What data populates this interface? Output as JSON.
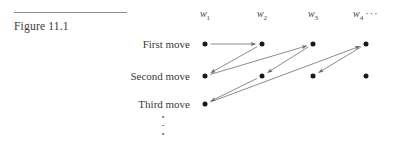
{
  "figure": {
    "caption": "Figure 11.1",
    "rule_color": "#8a8a8a"
  },
  "columns": [
    {
      "label": "w",
      "subscript": "1",
      "x": 205
    },
    {
      "label": "w",
      "subscript": "2",
      "x": 262
    },
    {
      "label": "w",
      "subscript": "3",
      "x": 313
    },
    {
      "label": "w",
      "subscript": "4",
      "x": 366
    }
  ],
  "column_trailing_ellipsis": "···",
  "rows": [
    {
      "label": "First move",
      "y": 44
    },
    {
      "label": "Second move",
      "y": 76
    },
    {
      "label": "Third move",
      "y": 104
    }
  ],
  "row_continuation_dots": 3,
  "nodes": [
    {
      "col": 0,
      "row": 0
    },
    {
      "col": 1,
      "row": 0
    },
    {
      "col": 2,
      "row": 0
    },
    {
      "col": 3,
      "row": 0
    },
    {
      "col": 0,
      "row": 1
    },
    {
      "col": 1,
      "row": 1
    },
    {
      "col": 2,
      "row": 1
    },
    {
      "col": 3,
      "row": 1
    },
    {
      "col": 0,
      "row": 2
    }
  ],
  "arrows": [
    {
      "from": {
        "col": 0,
        "row": 0
      },
      "to": {
        "col": 1,
        "row": 0
      },
      "name": "arrow-w1r1-to-w2r1"
    },
    {
      "from": {
        "col": 1,
        "row": 0
      },
      "to": {
        "col": 0,
        "row": 1
      },
      "name": "arrow-w2r1-to-w1r2"
    },
    {
      "from": {
        "col": 0,
        "row": 1
      },
      "to": {
        "col": 2,
        "row": 0
      },
      "name": "arrow-w1r2-to-w3r1"
    },
    {
      "from": {
        "col": 2,
        "row": 0
      },
      "to": {
        "col": 1,
        "row": 1
      },
      "name": "arrow-w3r1-to-w2r2"
    },
    {
      "from": {
        "col": 1,
        "row": 1
      },
      "to": {
        "col": 0,
        "row": 2
      },
      "name": "arrow-w2r2-to-w1r3"
    },
    {
      "from": {
        "col": 0,
        "row": 2
      },
      "to": {
        "col": 3,
        "row": 0
      },
      "name": "arrow-w1r3-to-w4r1"
    },
    {
      "from": {
        "col": 3,
        "row": 0
      },
      "to": {
        "col": 2,
        "row": 1
      },
      "name": "arrow-w4r1-to-w3r2"
    }
  ],
  "style": {
    "arrow_color": "#6e6e6e",
    "node_color": "#1a1a1a",
    "text_color": "#3a3a3a"
  }
}
